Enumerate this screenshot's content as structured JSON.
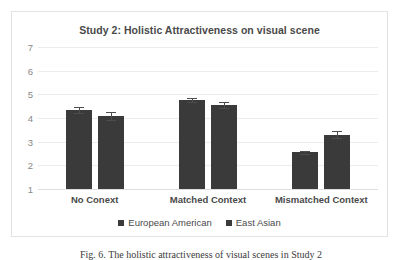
{
  "chart_data": {
    "type": "bar",
    "title": "Study 2: Holistic Attractiveness on visual scene",
    "xlabel": "",
    "ylabel": "",
    "categories": [
      "No Conext",
      "Matched Context",
      "Mismatched Context"
    ],
    "series": [
      {
        "name": "European American",
        "color": "#3a3a3a",
        "values": [
          4.35,
          4.75,
          2.55
        ],
        "errors": [
          0.12,
          0.08,
          0.05
        ]
      },
      {
        "name": "East Asian",
        "color": "#3a3a3a",
        "values": [
          4.1,
          4.55,
          3.3
        ],
        "errors": [
          0.17,
          0.12,
          0.13
        ]
      }
    ],
    "yticks": [
      7,
      6,
      5,
      4,
      3,
      2,
      1
    ],
    "ylim": [
      1,
      7
    ],
    "grid": true,
    "legend_position": "bottom",
    "error_bars": true
  },
  "legend": {
    "items": [
      {
        "label": "European American",
        "marker": "square-marker"
      },
      {
        "label": "East Asian",
        "marker": "square-marker"
      }
    ]
  },
  "caption": {
    "text": "Fig. 6. The holistic attractiveness of visual scenes in Study 2"
  }
}
